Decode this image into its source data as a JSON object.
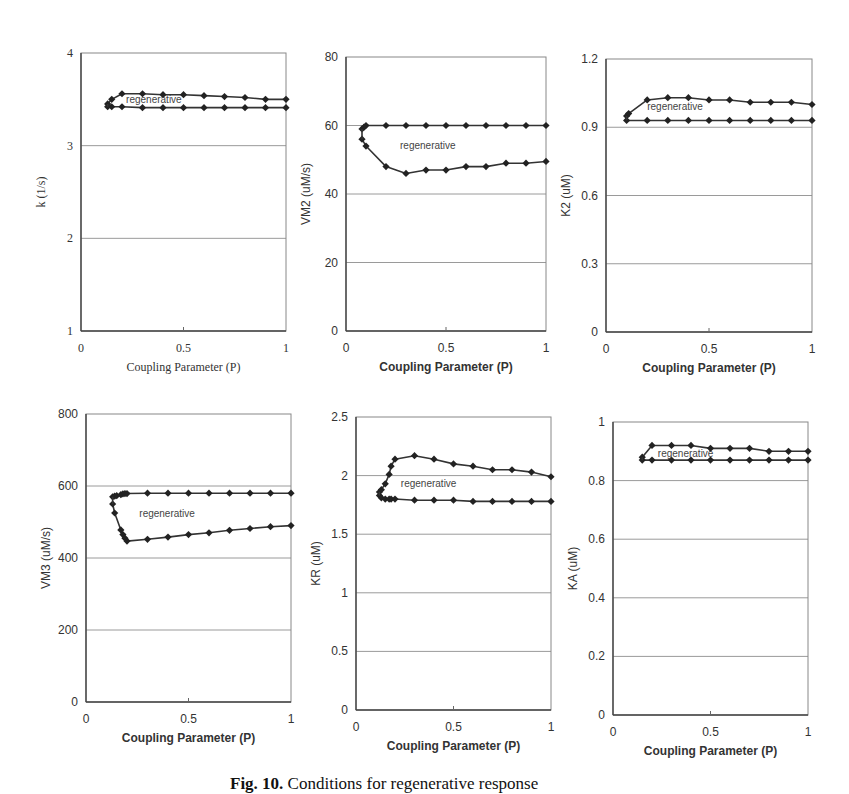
{
  "figure": {
    "caption_label": "Fig. 10.",
    "caption_text": "Conditions for regenerative response"
  },
  "chart_data": [
    {
      "type": "line",
      "id": "k",
      "title": "",
      "xlabel": "Coupling Parameter (P)",
      "ylabel": "k (1/s)",
      "serif": true,
      "xlim": [
        0,
        1
      ],
      "ylim": [
        1,
        4
      ],
      "xticks": [
        "0",
        "0.5",
        "1"
      ],
      "xtick_values": [
        0,
        0.5,
        1
      ],
      "yticks": [
        "1",
        "2",
        "3",
        "4"
      ],
      "ytick_values": [
        1,
        2,
        3,
        4
      ],
      "grid": true,
      "annotation": {
        "text": "regenerative",
        "x": 0.22,
        "y": 3.46
      },
      "frame": {
        "left": 81,
        "top": 53,
        "right": 286,
        "bottom": 331
      },
      "series": [
        {
          "name": "upper boundary",
          "x": [
            0.13,
            0.15,
            0.2,
            0.3,
            0.4,
            0.5,
            0.6,
            0.7,
            0.8,
            0.9,
            1.0
          ],
          "y": [
            3.45,
            3.5,
            3.56,
            3.56,
            3.55,
            3.55,
            3.54,
            3.53,
            3.52,
            3.5,
            3.5
          ]
        },
        {
          "name": "lower boundary",
          "x": [
            0.13,
            0.15,
            0.2,
            0.3,
            0.4,
            0.5,
            0.6,
            0.7,
            0.8,
            0.9,
            1.0
          ],
          "y": [
            3.42,
            3.42,
            3.42,
            3.41,
            3.41,
            3.41,
            3.41,
            3.41,
            3.41,
            3.41,
            3.41
          ]
        }
      ]
    },
    {
      "type": "line",
      "id": "vm2",
      "title": "",
      "xlabel": "Coupling Parameter (P)",
      "ylabel": "VM2 (uM/s)",
      "serif": false,
      "xlim": [
        0,
        1
      ],
      "ylim": [
        0,
        80
      ],
      "xticks": [
        "0",
        "0.5",
        "1"
      ],
      "xtick_values": [
        0,
        0.5,
        1
      ],
      "yticks": [
        "0",
        "20",
        "40",
        "60",
        "80"
      ],
      "ytick_values": [
        0,
        20,
        40,
        60,
        80
      ],
      "grid": true,
      "annotation": {
        "text": "regenerative",
        "x": 0.27,
        "y": 53
      },
      "frame": {
        "left": 346,
        "top": 57,
        "right": 546,
        "bottom": 331
      },
      "series": [
        {
          "name": "upper boundary",
          "x": [
            0.08,
            0.09,
            0.1,
            0.2,
            0.3,
            0.4,
            0.5,
            0.6,
            0.7,
            0.8,
            0.9,
            1.0
          ],
          "y": [
            59,
            59.5,
            60,
            60,
            60,
            60,
            60,
            60,
            60,
            60,
            60,
            60
          ]
        },
        {
          "name": "lower boundary",
          "x": [
            0.08,
            0.1,
            0.2,
            0.3,
            0.4,
            0.5,
            0.6,
            0.7,
            0.8,
            0.9,
            1.0
          ],
          "y": [
            56,
            54,
            48,
            46,
            47,
            47,
            48,
            48,
            49,
            49,
            49.5
          ]
        }
      ]
    },
    {
      "type": "line",
      "id": "k2",
      "title": "",
      "xlabel": "Coupling Parameter (P)",
      "ylabel": "K2 (uM)",
      "serif": false,
      "xlim": [
        0,
        1
      ],
      "ylim": [
        0,
        1.2
      ],
      "xticks": [
        "0",
        "0.5",
        "1"
      ],
      "xtick_values": [
        0,
        0.5,
        1
      ],
      "yticks": [
        "0",
        "0.3",
        "0.6",
        "0.9",
        "1.2"
      ],
      "ytick_values": [
        0,
        0.3,
        0.6,
        0.9,
        1.2
      ],
      "grid": true,
      "annotation": {
        "text": "regenerative",
        "x": 0.2,
        "y": 0.975
      },
      "frame": {
        "left": 606,
        "top": 59,
        "right": 812,
        "bottom": 332
      },
      "series": [
        {
          "name": "upper boundary",
          "x": [
            0.1,
            0.11,
            0.2,
            0.3,
            0.4,
            0.5,
            0.6,
            0.7,
            0.8,
            0.9,
            1.0
          ],
          "y": [
            0.95,
            0.96,
            1.02,
            1.03,
            1.03,
            1.02,
            1.02,
            1.01,
            1.01,
            1.01,
            1.0
          ]
        },
        {
          "name": "lower boundary",
          "x": [
            0.1,
            0.2,
            0.3,
            0.4,
            0.5,
            0.6,
            0.7,
            0.8,
            0.9,
            1.0
          ],
          "y": [
            0.93,
            0.93,
            0.93,
            0.93,
            0.93,
            0.93,
            0.93,
            0.93,
            0.93,
            0.93
          ]
        }
      ]
    },
    {
      "type": "line",
      "id": "vm3",
      "title": "",
      "xlabel": "Coupling Parameter (P)",
      "ylabel": "VM3 (uM/s)",
      "serif": false,
      "xlim": [
        0,
        1
      ],
      "ylim": [
        0,
        800
      ],
      "xticks": [
        "0",
        "0.5",
        "1"
      ],
      "xtick_values": [
        0,
        0.5,
        1
      ],
      "yticks": [
        "0",
        "200",
        "400",
        "600",
        "800"
      ],
      "ytick_values": [
        0,
        200,
        400,
        600,
        800
      ],
      "grid": true,
      "annotation": {
        "text": "regenerative",
        "x": 0.26,
        "y": 515
      },
      "frame": {
        "left": 86,
        "top": 414,
        "right": 291,
        "bottom": 702
      },
      "series": [
        {
          "name": "upper boundary",
          "x": [
            0.13,
            0.14,
            0.15,
            0.17,
            0.18,
            0.19,
            0.2,
            0.3,
            0.4,
            0.5,
            0.6,
            0.7,
            0.8,
            0.9,
            1.0
          ],
          "y": [
            570,
            572,
            573,
            576,
            578,
            579,
            579,
            580,
            580,
            580,
            580,
            580,
            580,
            580,
            580
          ]
        },
        {
          "name": "lower boundary",
          "x": [
            0.13,
            0.14,
            0.17,
            0.18,
            0.19,
            0.2,
            0.3,
            0.4,
            0.5,
            0.6,
            0.7,
            0.8,
            0.9,
            1.0
          ],
          "y": [
            550,
            525,
            478,
            465,
            455,
            447,
            452,
            458,
            465,
            470,
            477,
            482,
            487,
            490
          ]
        }
      ]
    },
    {
      "type": "line",
      "id": "kr",
      "title": "",
      "xlabel": "Coupling Parameter (P)",
      "ylabel": "KR (uM)",
      "serif": false,
      "xlim": [
        0,
        1
      ],
      "ylim": [
        0,
        2.5
      ],
      "xticks": [
        "0",
        "0.5",
        "1"
      ],
      "xtick_values": [
        0,
        0.5,
        1
      ],
      "yticks": [
        "0",
        "0.5",
        "1",
        "1.5",
        "2",
        "2.5"
      ],
      "ytick_values": [
        0,
        0.5,
        1,
        1.5,
        2,
        2.5
      ],
      "grid": true,
      "annotation": {
        "text": "regenerative",
        "x": 0.23,
        "y": 1.9
      },
      "frame": {
        "left": 356,
        "top": 417,
        "right": 551,
        "bottom": 710
      },
      "series": [
        {
          "name": "upper boundary",
          "x": [
            0.12,
            0.13,
            0.15,
            0.17,
            0.18,
            0.2,
            0.3,
            0.4,
            0.5,
            0.6,
            0.7,
            0.8,
            0.9,
            1.0
          ],
          "y": [
            1.86,
            1.88,
            1.93,
            2.01,
            2.08,
            2.14,
            2.17,
            2.14,
            2.1,
            2.08,
            2.05,
            2.05,
            2.03,
            1.99
          ]
        },
        {
          "name": "lower boundary",
          "x": [
            0.12,
            0.13,
            0.15,
            0.17,
            0.18,
            0.2,
            0.3,
            0.4,
            0.5,
            0.6,
            0.7,
            0.8,
            0.9,
            1.0
          ],
          "y": [
            1.83,
            1.81,
            1.8,
            1.8,
            1.8,
            1.8,
            1.79,
            1.79,
            1.79,
            1.78,
            1.78,
            1.78,
            1.78,
            1.78
          ]
        }
      ]
    },
    {
      "type": "line",
      "id": "ka",
      "title": "",
      "xlabel": "Coupling Parameter (P)",
      "ylabel": "KA (uM)",
      "serif": false,
      "xlim": [
        0,
        1
      ],
      "ylim": [
        0,
        1
      ],
      "xticks": [
        "0",
        "0.5",
        "1"
      ],
      "xtick_values": [
        0,
        0.5,
        1
      ],
      "yticks": [
        "0",
        "0.2",
        "0.4",
        "0.6",
        "0.8",
        "1"
      ],
      "ytick_values": [
        0,
        0.2,
        0.4,
        0.6,
        0.8,
        1
      ],
      "grid": true,
      "annotation": {
        "text": "regenerative",
        "x": 0.23,
        "y": 0.88
      },
      "frame": {
        "left": 613,
        "top": 422,
        "right": 808,
        "bottom": 715
      },
      "series": [
        {
          "name": "upper boundary",
          "x": [
            0.15,
            0.2,
            0.3,
            0.4,
            0.5,
            0.6,
            0.7,
            0.8,
            0.9,
            1.0
          ],
          "y": [
            0.88,
            0.92,
            0.92,
            0.92,
            0.91,
            0.91,
            0.91,
            0.9,
            0.9,
            0.9
          ]
        },
        {
          "name": "lower boundary",
          "x": [
            0.15,
            0.2,
            0.3,
            0.4,
            0.5,
            0.6,
            0.7,
            0.8,
            0.9,
            1.0
          ],
          "y": [
            0.87,
            0.87,
            0.87,
            0.87,
            0.87,
            0.87,
            0.87,
            0.87,
            0.87,
            0.87
          ]
        }
      ]
    }
  ]
}
